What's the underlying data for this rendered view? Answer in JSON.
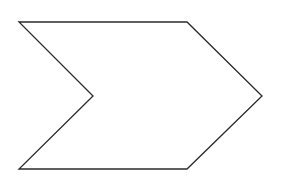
{
  "diagram": {
    "shape": "chevron",
    "canvas": {
      "width": 283,
      "height": 182
    },
    "background": "#ffffff",
    "stroke_color": "#2b2b2b",
    "stroke_width": 1.3,
    "fill_color": "#ffffff",
    "vertices": [
      {
        "name": "top-left",
        "x": 19,
        "y": 22
      },
      {
        "name": "top-right",
        "x": 187,
        "y": 22
      },
      {
        "name": "right-point",
        "x": 262,
        "y": 96
      },
      {
        "name": "bottom-right",
        "x": 187,
        "y": 169
      },
      {
        "name": "bottom-left",
        "x": 19,
        "y": 169
      },
      {
        "name": "inner-notch",
        "x": 93,
        "y": 96
      }
    ]
  }
}
